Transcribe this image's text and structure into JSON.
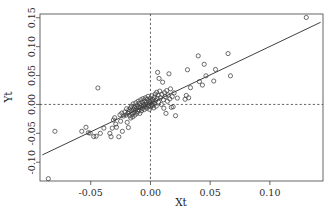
{
  "chart_data": {
    "type": "scatter",
    "title": "",
    "xlabel": "Xt",
    "ylabel": "Yt",
    "xlim": [
      -0.0925,
      0.1445
    ],
    "ylim": [
      -0.1325,
      0.1565
    ],
    "xticks": [
      -0.05,
      0.0,
      0.05,
      0.1
    ],
    "xticklabels": [
      "-0.05",
      "0.00",
      "0.05",
      "0.10"
    ],
    "yticks": [
      -0.1,
      -0.05,
      0.0,
      0.05,
      0.1,
      0.15
    ],
    "yticklabels": [
      "-0.10",
      "-0.05",
      "0.00",
      "0.05",
      "0.10",
      "0.15"
    ],
    "grid": false,
    "legend": null,
    "reference_lines": [
      {
        "orientation": "vertical",
        "value": 0.0,
        "style": "dashed"
      },
      {
        "orientation": "horizontal",
        "value": 0.0,
        "style": "dashed"
      }
    ],
    "fit_line": {
      "style": "solid",
      "intercept": 0.0018,
      "slope": 0.985,
      "x_start": -0.0905,
      "x_end": 0.1425
    },
    "marker": {
      "shape": "open-circle",
      "radius_px": 2.1
    },
    "points": [
      [
        -0.0855,
        -0.1285
      ],
      [
        -0.08,
        -0.0465
      ],
      [
        -0.0575,
        -0.0465
      ],
      [
        -0.054,
        -0.0395
      ],
      [
        -0.052,
        -0.049
      ],
      [
        -0.0505,
        -0.0495
      ],
      [
        -0.0475,
        -0.0555
      ],
      [
        -0.0455,
        -0.055
      ],
      [
        -0.044,
        0.0285
      ],
      [
        -0.042,
        -0.05
      ],
      [
        -0.039,
        -0.041
      ],
      [
        -0.034,
        -0.05
      ],
      [
        -0.033,
        -0.056
      ],
      [
        -0.032,
        -0.041
      ],
      [
        -0.031,
        -0.027
      ],
      [
        -0.03,
        -0.023
      ],
      [
        -0.029,
        -0.034
      ],
      [
        -0.0285,
        -0.0395
      ],
      [
        -0.0265,
        -0.056
      ],
      [
        -0.0255,
        -0.018
      ],
      [
        -0.025,
        -0.029
      ],
      [
        -0.024,
        -0.015
      ],
      [
        -0.0235,
        -0.0465
      ],
      [
        -0.0225,
        -0.02
      ],
      [
        -0.0215,
        -0.013
      ],
      [
        -0.0205,
        -0.0185
      ],
      [
        -0.02,
        -0.0075
      ],
      [
        -0.0195,
        -0.031
      ],
      [
        -0.019,
        -0.0155
      ],
      [
        -0.0185,
        -0.04
      ],
      [
        -0.018,
        -0.009
      ],
      [
        -0.0178,
        -0.0125
      ],
      [
        -0.0172,
        -0.0195
      ],
      [
        -0.0168,
        -0.006
      ],
      [
        -0.0165,
        -0.0235
      ],
      [
        -0.016,
        -0.0105
      ],
      [
        -0.0158,
        -0.003
      ],
      [
        -0.0152,
        -0.0165
      ],
      [
        -0.0148,
        -0.0215
      ],
      [
        -0.0145,
        0.001
      ],
      [
        -0.0142,
        -0.008
      ],
      [
        -0.0138,
        -0.014
      ],
      [
        -0.0133,
        -0.0045
      ],
      [
        -0.013,
        -0.0185
      ],
      [
        -0.0126,
        -0.01
      ],
      [
        -0.0122,
        0.003
      ],
      [
        -0.0118,
        -0.0065
      ],
      [
        -0.0114,
        -0.0155
      ],
      [
        -0.011,
        -0.002
      ],
      [
        -0.0106,
        -0.012
      ],
      [
        -0.0103,
        0.0055
      ],
      [
        -0.01,
        -0.0045
      ],
      [
        -0.0096,
        -0.0095
      ],
      [
        -0.0092,
        0.0015
      ],
      [
        -0.0089,
        -0.0155
      ],
      [
        -0.0085,
        -0.0055
      ],
      [
        -0.0082,
        0.008
      ],
      [
        -0.0078,
        -0.002
      ],
      [
        -0.0074,
        -0.011
      ],
      [
        -0.007,
        0.004
      ],
      [
        -0.0067,
        -0.007
      ],
      [
        -0.0063,
        0.01
      ],
      [
        -0.006,
        -0.003
      ],
      [
        -0.0056,
        0.0
      ],
      [
        -0.0052,
        -0.009
      ],
      [
        -0.0049,
        0.006
      ],
      [
        -0.0045,
        -0.004
      ],
      [
        -0.0042,
        0.0115
      ],
      [
        -0.0038,
        -0.001
      ],
      [
        -0.0034,
        0.0035
      ],
      [
        -0.003,
        -0.0065
      ],
      [
        -0.0027,
        0.009
      ],
      [
        -0.0023,
        0.0
      ],
      [
        -0.002,
        0.014
      ],
      [
        -0.0016,
        -0.003
      ],
      [
        -0.0012,
        0.0055
      ],
      [
        -0.0009,
        -0.0085
      ],
      [
        -0.0005,
        0.002
      ],
      [
        -0.0002,
        0.0105
      ],
      [
        0.0002,
        -0.0045
      ],
      [
        0.0005,
        0.0065
      ],
      [
        0.0009,
        0.0
      ],
      [
        0.0012,
        0.015
      ],
      [
        0.0016,
        -0.002
      ],
      [
        0.002,
        0.0085
      ],
      [
        0.0024,
        0.004
      ],
      [
        0.0028,
        -0.006
      ],
      [
        0.0032,
        0.0125
      ],
      [
        0.0036,
        0.001
      ],
      [
        0.004,
        0.018
      ],
      [
        0.0044,
        0.007
      ],
      [
        0.0048,
        -0.003
      ],
      [
        0.0052,
        0.021
      ],
      [
        0.0056,
        0.0105
      ],
      [
        0.006,
        0.0555
      ],
      [
        0.0064,
        0.016
      ],
      [
        0.0068,
        0.004
      ],
      [
        0.0072,
        0.045
      ],
      [
        0.0078,
        0.023
      ],
      [
        0.0084,
        0.0115
      ],
      [
        0.009,
        0.0
      ],
      [
        0.0096,
        0.0175
      ],
      [
        0.0102,
        0.0385
      ],
      [
        0.0108,
        0.008
      ],
      [
        0.0112,
        -0.0065
      ],
      [
        0.0118,
        0.0205
      ],
      [
        0.0124,
        0.0135
      ],
      [
        0.013,
        -0.0155
      ],
      [
        0.0136,
        0.024
      ],
      [
        0.0142,
        0.0055
      ],
      [
        0.0148,
        0.0165
      ],
      [
        0.0155,
        0.053
      ],
      [
        0.0162,
        0.0095
      ],
      [
        0.0168,
        0.027
      ],
      [
        0.0175,
        -0.005
      ],
      [
        0.0182,
        0.0135
      ],
      [
        0.019,
        -0.004
      ],
      [
        0.0198,
        0.02
      ],
      [
        0.021,
        -0.0195
      ],
      [
        0.0225,
        0.011
      ],
      [
        0.029,
        0.009
      ],
      [
        0.03,
        0.0155
      ],
      [
        0.031,
        0.06
      ],
      [
        0.032,
        0.0115
      ],
      [
        0.0335,
        0.029
      ],
      [
        0.04,
        0.084
      ],
      [
        0.041,
        0.0395
      ],
      [
        0.0435,
        0.0335
      ],
      [
        0.045,
        0.0695
      ],
      [
        0.0465,
        0.0495
      ],
      [
        0.053,
        0.0405
      ],
      [
        0.0545,
        0.0605
      ],
      [
        0.065,
        0.088
      ],
      [
        0.067,
        0.0495
      ],
      [
        0.1305,
        0.1505
      ]
    ]
  }
}
